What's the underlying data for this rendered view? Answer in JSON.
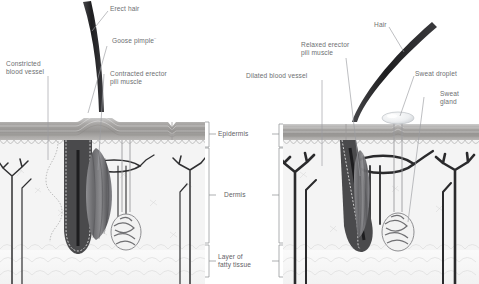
{
  "figure": {
    "panels": [
      {
        "id": "left",
        "condition": "cold-response"
      },
      {
        "id": "right",
        "condition": "heat-response"
      }
    ]
  },
  "labels": {
    "erect_hair": "Erect hair",
    "goose_pimple": "Goose pimple¨",
    "contracted_muscle_1": "Contracted erector",
    "contracted_muscle_2": "pili muscle",
    "constricted_vessel_1": "Constricted",
    "constricted_vessel_2": "blood vessel",
    "relaxed_muscle_1": "Relaxed erector",
    "relaxed_muscle_2": "pili muscle",
    "dilated_vessel": "Dilated blood vessel",
    "hair": "Hair",
    "sweat_droplet": "Sweat droplet",
    "sweat_gland_1": "Sweat",
    "sweat_gland_2": "gland"
  },
  "layers": {
    "epidermis": "Epidermis",
    "dermis": "Dermis",
    "fatty_1": "Layer of",
    "fatty_2": "fatty tissue"
  },
  "colors": {
    "label_text": "#6d6f72",
    "leader_line": "#9a9ca0",
    "epidermis_upper": "#cfcfcf",
    "epidermis_mid": "#a8a6a4",
    "epidermis_lower": "#8e8c8a",
    "basal_layer": "#f2f2f2",
    "dermis_fill": "#f3f3f3",
    "fat_fill": "#f7f7f7",
    "vessel_dark": "#2e2e30",
    "vessel_mid": "#58585a",
    "muscle": "#6b6b6e",
    "hair_shaft": "#242426",
    "follicle": "#4a4a4c",
    "bracket": "#8a8c90"
  }
}
